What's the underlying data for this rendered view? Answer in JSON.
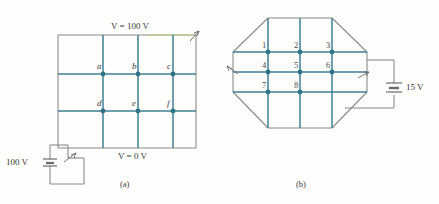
{
  "figure": {
    "background_color": "#fdfdfb",
    "wire_color_gray": "#8a8a8a",
    "wire_color_teal": "#3d7f96",
    "node_color": "#2f7388",
    "accent_green": "#7d9a4e",
    "text_color": "#3b3b3b"
  },
  "panel_a": {
    "caption": "(a)",
    "top_label": "V = 100 V",
    "bottom_label": "V = 0 V",
    "battery_label": "100 V",
    "node_labels": [
      "a",
      "b",
      "c",
      "d",
      "e",
      "f"
    ],
    "grid_columns": 4,
    "grid_rows": 3
  },
  "panel_b": {
    "caption": "(b)",
    "battery_label": "15 V",
    "node_labels": [
      "1",
      "2",
      "3",
      "4",
      "5",
      "6",
      "7",
      "8"
    ],
    "grid_columns": 3,
    "grid_rows": 3,
    "shape": "octagon"
  }
}
